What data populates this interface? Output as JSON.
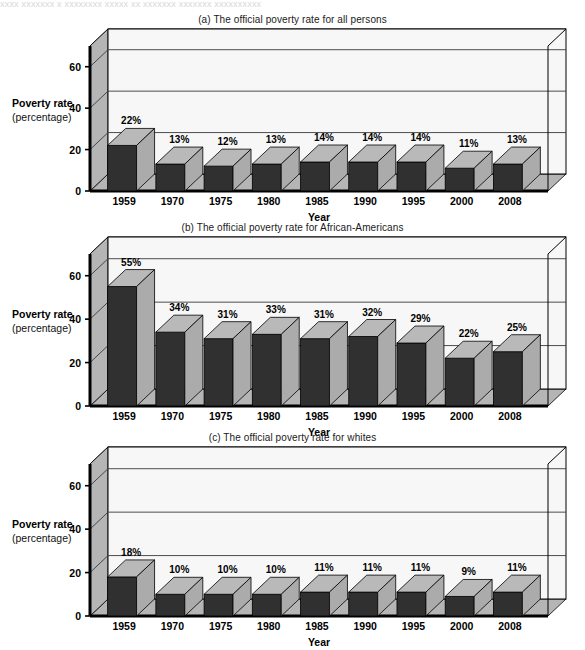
{
  "page": {
    "cutoff_text_top": "xxxx  xxxxxxx  x  xxxxxxxx   xxxxx   xx xxxxxxx xxxxxxx  xxxxxxxxxx"
  },
  "axis": {
    "y_title": "Poverty rate",
    "y_subtitle": "(percentage)",
    "x_title": "Year",
    "y_ticks": [
      "0",
      "20",
      "40",
      "60"
    ],
    "y_tick_values": [
      0,
      20,
      40,
      60
    ],
    "ymax_axis": 70
  },
  "colors": {
    "bar_front": "#303030",
    "bar_top": "#b9b9b9",
    "bar_side": "#ababab",
    "wall_back": "#f7f7f7",
    "wall_left": "#b5b5b5",
    "wall_top": "#e6e6e6",
    "floor": "#b5b5b5",
    "gridline": "#3a3a3a",
    "outline": "#000000",
    "text": "#000000"
  },
  "chart_data": [
    {
      "type": "bar",
      "id": "all-persons",
      "title": "(a) The official poverty rate for all persons",
      "xlabel": "Year",
      "ylabel": "Poverty rate (percentage)",
      "categories": [
        "1959",
        "1970",
        "1975",
        "1980",
        "1985",
        "1990",
        "1995",
        "2000",
        "2008"
      ],
      "values": [
        22,
        13,
        12,
        13,
        14,
        14,
        14,
        11,
        13
      ],
      "data_labels": [
        "22%",
        "13%",
        "12%",
        "13%",
        "14%",
        "14%",
        "14%",
        "11%",
        "13%"
      ],
      "ylim": [
        0,
        70
      ],
      "yticks": [
        0,
        20,
        40,
        60
      ],
      "grid": true,
      "legend": "none"
    },
    {
      "type": "bar",
      "id": "african-americans",
      "title": "(b) The official poverty rate for African-Americans",
      "xlabel": "Year",
      "ylabel": "Poverty rate (percentage)",
      "categories": [
        "1959",
        "1970",
        "1975",
        "1980",
        "1985",
        "1990",
        "1995",
        "2000",
        "2008"
      ],
      "values": [
        55,
        34,
        31,
        33,
        31,
        32,
        29,
        22,
        25
      ],
      "data_labels": [
        "55%",
        "34%",
        "31%",
        "33%",
        "31%",
        "32%",
        "29%",
        "22%",
        "25%"
      ],
      "ylim": [
        0,
        70
      ],
      "yticks": [
        0,
        20,
        40,
        60
      ],
      "grid": true,
      "legend": "none"
    },
    {
      "type": "bar",
      "id": "whites",
      "title": "(c) The official poverty rate for whites",
      "xlabel": "Year",
      "ylabel": "Poverty rate (percentage)",
      "categories": [
        "1959",
        "1970",
        "1975",
        "1980",
        "1985",
        "1990",
        "1995",
        "2000",
        "2008"
      ],
      "values": [
        18,
        10,
        10,
        10,
        11,
        11,
        11,
        9,
        11
      ],
      "data_labels": [
        "18%",
        "10%",
        "10%",
        "10%",
        "11%",
        "11%",
        "11%",
        "9%",
        "11%"
      ],
      "ylim": [
        0,
        70
      ],
      "yticks": [
        0,
        20,
        40,
        60
      ],
      "grid": true,
      "legend": "none"
    }
  ]
}
